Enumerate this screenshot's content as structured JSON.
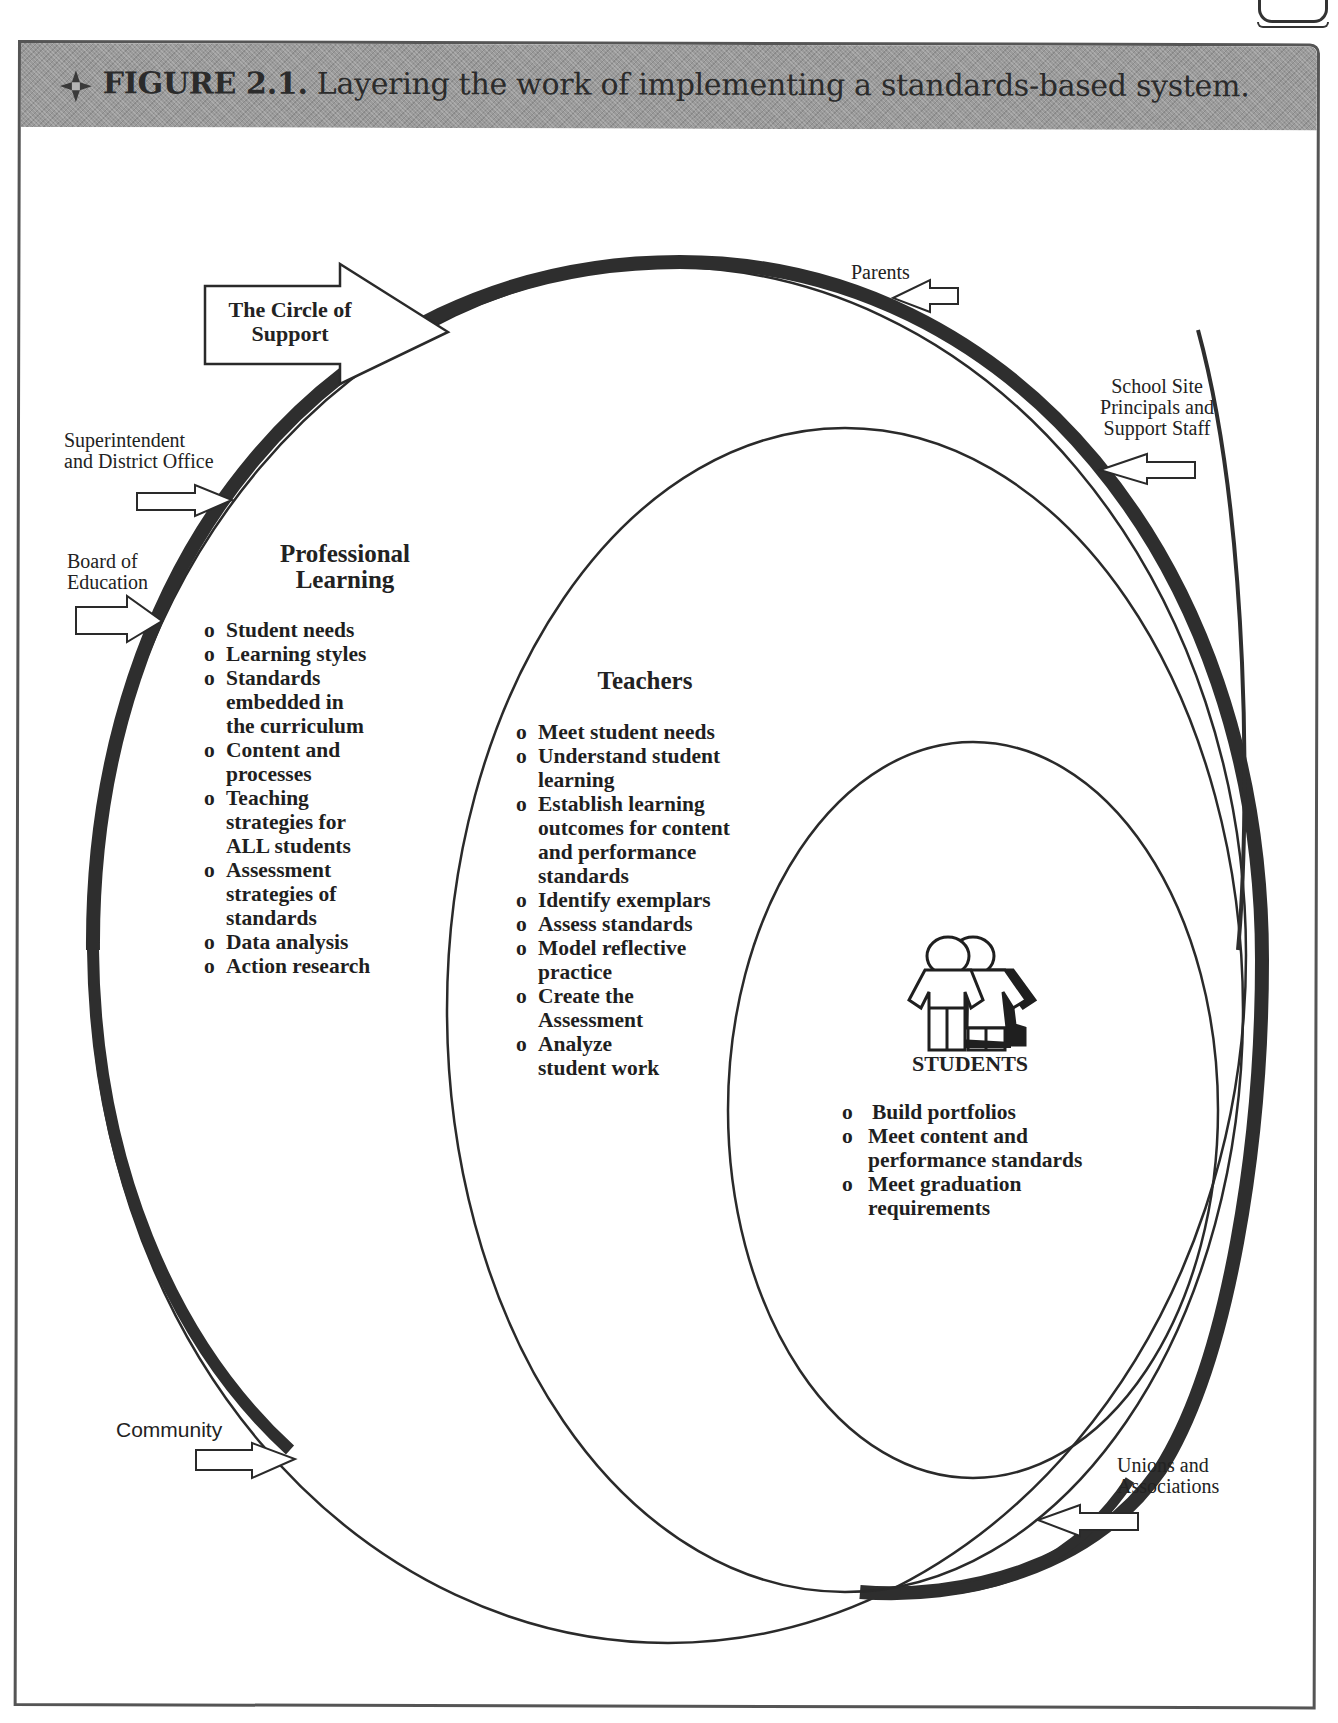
{
  "figure": {
    "number": "FIGURE 2.1.",
    "caption": "Layering the work of implementing a standards-based system.",
    "icon": "four-point-diamond-icon"
  },
  "circle_of_support": {
    "label": "The Circle of Support",
    "label_lines": [
      "The Circle of",
      "Support"
    ]
  },
  "stakeholders": [
    {
      "id": "parents",
      "lines": [
        "Parents"
      ]
    },
    {
      "id": "school-site",
      "lines": [
        "School Site",
        "Principals and",
        "Support Staff"
      ]
    },
    {
      "id": "superintendent",
      "lines": [
        "Superintendent",
        "and District Office"
      ]
    },
    {
      "id": "board",
      "lines": [
        "Board of",
        "Education"
      ]
    },
    {
      "id": "community",
      "lines": [
        "Community"
      ]
    },
    {
      "id": "unions",
      "lines": [
        "Unions and",
        "Associations"
      ]
    }
  ],
  "professional_learning": {
    "heading_lines": [
      "Professional",
      "Learning"
    ],
    "bullet": "o",
    "items": [
      "Student needs",
      "Learning styles",
      "Standards\nembedded in\nthe curriculum",
      "Content and\nprocesses",
      "Teaching\nstrategies for\nALL students",
      "Assessment\nstrategies of\nstandards",
      "Data analysis",
      "Action research"
    ]
  },
  "teachers": {
    "heading": "Teachers",
    "bullet": "o",
    "items": [
      "Meet student needs",
      "Understand student\nlearning",
      "Establish learning\noutcomes for content\nand performance\nstandards",
      "Identify exemplars",
      "Assess standards",
      "Model reflective\npractice",
      "Create the\nAssessment",
      "Analyze\nstudent work"
    ]
  },
  "students": {
    "heading": "STUDENTS",
    "icon": "students-pair-icon",
    "bullet": "o",
    "items": [
      "Build portfolios",
      "Meet content  and\nperformance standards",
      "Meet graduation\nrequirements"
    ]
  },
  "colors": {
    "header_band": "#9a9a9a",
    "ink": "#222222",
    "thick_ring": "#2e2e2e"
  }
}
